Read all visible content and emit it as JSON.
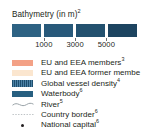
{
  "legend": {
    "bathymetry": {
      "title_text": "Bathymetry (in m)",
      "title_superscript": "2",
      "swatch_colors": [
        "#2d6283",
        "#28597a",
        "#23516f",
        "#1d4460"
      ],
      "tick_labels": [
        "1000",
        "3000",
        "5000"
      ],
      "tick_positions_pct": [
        25.5,
        50.5,
        75.5
      ]
    },
    "rows": [
      {
        "label": "EU and EEA members",
        "superscript": "3",
        "symbol": "color-swatch",
        "symbol_name": "swatch-eu-eea-members",
        "color": "#f3a186"
      },
      {
        "label": "EU and EEA former membe",
        "superscript": "",
        "symbol": "color-swatch",
        "symbol_name": "swatch-eu-eea-former-members",
        "color": "#fbe6cf"
      },
      {
        "label": "Global vessel density",
        "superscript": "4",
        "symbol": "hatch-swatch",
        "symbol_name": "swatch-global-vessel-density",
        "color": "#356e91"
      },
      {
        "label": "Waterbody",
        "superscript": "6",
        "symbol": "color-swatch",
        "symbol_name": "swatch-waterbody",
        "color": "#275f80"
      },
      {
        "label": "River",
        "superscript": "5",
        "symbol": "wavy-line",
        "symbol_name": "line-river",
        "color": "#9aa3a8"
      },
      {
        "label": "Country border",
        "superscript": "6",
        "symbol": "dotted-line",
        "symbol_name": "line-country-border",
        "color": "#b5bbbe"
      },
      {
        "label": "National capital",
        "superscript": "6",
        "symbol": "dot-marker",
        "symbol_name": "marker-national-capital",
        "color": "#231f20"
      }
    ]
  }
}
